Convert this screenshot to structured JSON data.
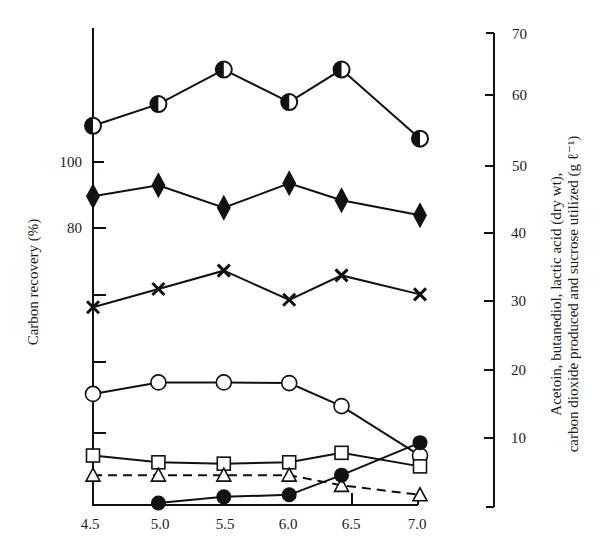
{
  "chart_data": {
    "type": "line",
    "title": "",
    "xlabel": "",
    "ylabel_left": "Carbon recovery (%)",
    "ylabel_right_line1": "Acetoin, butanediol, lactic acid (dry wt),",
    "ylabel_right_line2": "carbon dioxide produced and sucrose utilized (g ℓ⁻¹)",
    "x_ticks": [
      "4.5",
      "5.0",
      "5.5",
      "6.0",
      "6.5",
      "7.0"
    ],
    "xlim": [
      4.5,
      7.0
    ],
    "y_left_ticks": [
      "100",
      "80"
    ],
    "y_right_ticks": [
      "70",
      "60",
      "50",
      "40",
      "30",
      "20",
      "10"
    ],
    "ylim_right": [
      0,
      70
    ],
    "grid": false,
    "legend": "none (series identified by marker symbols)",
    "x": [
      4.5,
      5.0,
      5.5,
      6.0,
      6.4,
      7.0
    ],
    "series": [
      {
        "name": "half-filled circle (carbon recovery)",
        "marker": "half-circle",
        "dashed": false,
        "axis": "left",
        "values": [
          56.3,
          59.5,
          64.6,
          59.8,
          64.6,
          54.4
        ]
      },
      {
        "name": "filled diamond",
        "marker": "diamond",
        "dashed": false,
        "axis": "right",
        "values": [
          45.9,
          47.5,
          44.2,
          47.8,
          45.3,
          43.1
        ]
      },
      {
        "name": "cross",
        "marker": "cross",
        "dashed": false,
        "axis": "right",
        "values": [
          29.5,
          32.2,
          34.9,
          30.6,
          34.2,
          31.4
        ]
      },
      {
        "name": "open circle",
        "marker": "open-circle",
        "dashed": false,
        "axis": "right",
        "values": [
          16.7,
          18.4,
          18.4,
          18.3,
          14.9,
          7.6
        ]
      },
      {
        "name": "open square",
        "marker": "square",
        "dashed": false,
        "axis": "right",
        "values": [
          7.6,
          6.6,
          6.4,
          6.6,
          8.0,
          6.0
        ]
      },
      {
        "name": "open triangle",
        "marker": "triangle",
        "dashed": true,
        "axis": "right",
        "values": [
          4.7,
          4.7,
          4.7,
          4.7,
          3.2,
          1.8
        ]
      },
      {
        "name": "filled circle",
        "marker": "filled-circle",
        "dashed": false,
        "axis": "right",
        "values": [
          null,
          0.6,
          1.5,
          1.8,
          4.7,
          9.5
        ]
      }
    ]
  }
}
